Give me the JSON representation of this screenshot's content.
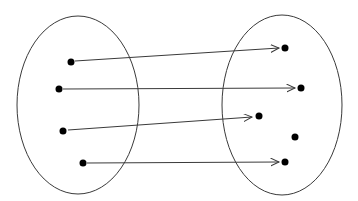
{
  "diagram": {
    "type": "set-mapping-diagram",
    "width": 358,
    "height": 201,
    "colors": {
      "background": "#ffffff",
      "line": "#3a3a3a",
      "dot": "#000000"
    },
    "stroke_width": 1,
    "dot_radius": 3.5,
    "ellipses": [
      {
        "name": "domain-set-ellipse",
        "cx": 78,
        "cy": 105,
        "rx": 61,
        "ry": 89
      },
      {
        "name": "codomain-set-ellipse",
        "cx": 282,
        "cy": 105,
        "rx": 60,
        "ry": 90
      }
    ],
    "dots": [
      {
        "name": "domain-element-1",
        "x": 71,
        "y": 62
      },
      {
        "name": "domain-element-2",
        "x": 59,
        "y": 89
      },
      {
        "name": "domain-element-3",
        "x": 63,
        "y": 131
      },
      {
        "name": "domain-element-4",
        "x": 83,
        "y": 163
      },
      {
        "name": "codomain-element-1",
        "x": 285,
        "y": 48
      },
      {
        "name": "codomain-element-2",
        "x": 301,
        "y": 88
      },
      {
        "name": "codomain-element-3",
        "x": 259,
        "y": 116
      },
      {
        "name": "codomain-element-4",
        "x": 295,
        "y": 137
      },
      {
        "name": "codomain-element-5",
        "x": 285,
        "y": 162
      }
    ],
    "arrows": [
      {
        "name": "mapping-arrow-1",
        "x1": 75,
        "y1": 61,
        "x2": 279,
        "y2": 48
      },
      {
        "name": "mapping-arrow-2",
        "x1": 63,
        "y1": 89,
        "x2": 295,
        "y2": 88
      },
      {
        "name": "mapping-arrow-3",
        "x1": 68,
        "y1": 130,
        "x2": 252,
        "y2": 117
      },
      {
        "name": "mapping-arrow-4",
        "x1": 87,
        "y1": 163,
        "x2": 279,
        "y2": 162
      }
    ]
  }
}
